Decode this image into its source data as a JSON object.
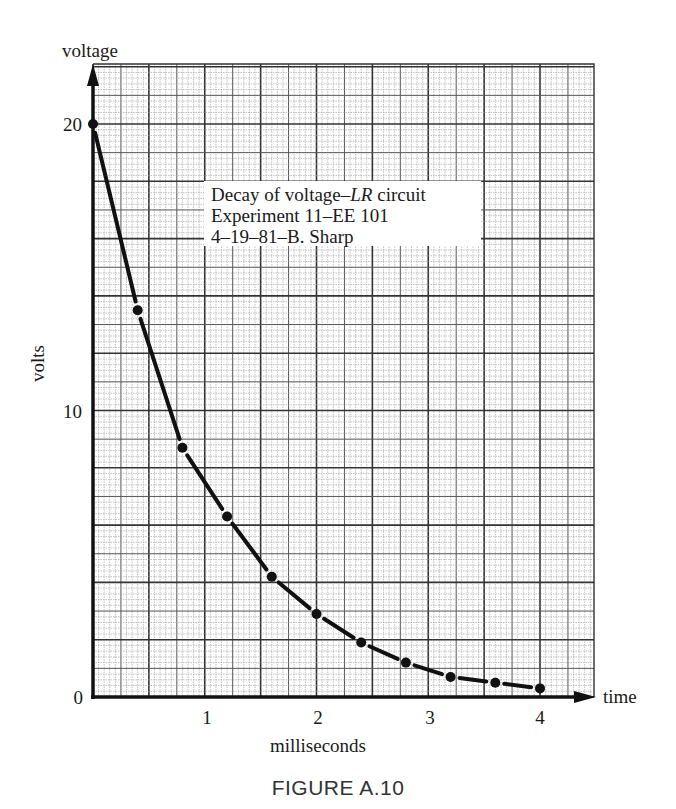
{
  "chart_data": {
    "type": "scatter",
    "title": "Decay of voltage–LR circuit",
    "annotation_lines": [
      "Decay of voltage–LR circuit",
      "Experiment 11–EE 101",
      "4–19–81–B. Sharp"
    ],
    "annotation_italic": "LR",
    "xlabel": "milliseconds",
    "ylabel": "volts",
    "x_axis_end_label": "time",
    "y_axis_end_label": "voltage",
    "x_ticks": [
      1,
      2,
      3,
      4
    ],
    "y_ticks": [
      0,
      10,
      20
    ],
    "xlim": [
      0,
      4.45
    ],
    "ylim": [
      0,
      22.5
    ],
    "grid": true,
    "grid_style": "graph paper (fine 0.05 ms / 0.2 V, bold every 0.5 ms / 2 V)",
    "legend": null,
    "line_style": "dashed curve through points",
    "x": [
      0,
      0.4,
      0.8,
      1.2,
      1.6,
      2.0,
      2.4,
      2.8,
      3.2,
      3.6,
      4.0
    ],
    "series": [
      {
        "name": "voltage",
        "values": [
          20.0,
          13.5,
          8.7,
          6.3,
          4.2,
          2.9,
          1.9,
          1.2,
          0.7,
          0.5,
          0.3
        ]
      }
    ],
    "caption": "FIGURE A.10"
  },
  "labels": {
    "y_axis_top": "voltage",
    "y_axis_title": "volts",
    "x_axis_title": "milliseconds",
    "x_axis_end": "time",
    "y_tick_0": "0",
    "y_tick_10": "10",
    "y_tick_20": "20",
    "x_tick_1": "1",
    "x_tick_2": "2",
    "x_tick_3": "3",
    "x_tick_4": "4",
    "note_line1_a": "Decay of voltage–",
    "note_line1_b": "LR",
    "note_line1_c": " circuit",
    "note_line2": "Experiment 11–EE 101",
    "note_line3": "4–19–81–B. Sharp",
    "caption": "FIGURE A.10"
  }
}
